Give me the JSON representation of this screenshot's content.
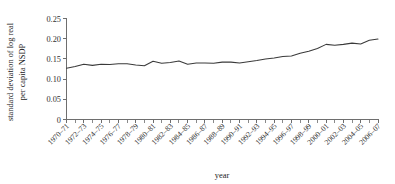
{
  "chart_data": {
    "type": "line",
    "title": "",
    "xlabel": "year",
    "ylabel": "standard deviation of log real per capita NSDP",
    "ylabel_lines": [
      "standard deviation of log real",
      "per capita NSDP"
    ],
    "ylim": [
      0,
      0.25
    ],
    "ytick_labels": [
      "0",
      "0.05",
      "0.10",
      "0.15",
      "0.20",
      "0.25"
    ],
    "ytick_values": [
      0,
      0.05,
      0.1,
      0.15,
      0.2,
      0.25
    ],
    "grid": false,
    "legend": "none",
    "line_color": "#3a3a3a",
    "categories": [
      "1970-71",
      "1971-72",
      "1972-73",
      "1973-74",
      "1974-75",
      "1975-76",
      "1976-77",
      "1977-78",
      "1978-79",
      "1979-80",
      "1980-81",
      "1981-82",
      "1982-83",
      "1983-84",
      "1984-85",
      "1985-86",
      "1986-87",
      "1987-88",
      "1988-89",
      "1989-90",
      "1990-91",
      "1991-92",
      "1992-93",
      "1993-94",
      "1994-95",
      "1995-96",
      "1996-97",
      "1997-98",
      "1998-99",
      "1999-2000",
      "2000-01",
      "2001-02",
      "2002-03",
      "2003-04",
      "2004-05",
      "2005-06",
      "2006-07"
    ],
    "xtick_labels": [
      "1970–71",
      "1972–73",
      "1974–75",
      "1976–77",
      "1978–79",
      "1980–81",
      "1982–83",
      "1984–85",
      "1986–87",
      "1988–89",
      "1990–91",
      "1992–93",
      "1994–95",
      "1996–97",
      "1998–99",
      "2000–01",
      "2002–03",
      "2004–05",
      "2006–07"
    ],
    "values": [
      0.127,
      0.131,
      0.137,
      0.134,
      0.137,
      0.136,
      0.138,
      0.138,
      0.135,
      0.133,
      0.144,
      0.139,
      0.141,
      0.145,
      0.137,
      0.14,
      0.14,
      0.139,
      0.142,
      0.142,
      0.14,
      0.143,
      0.146,
      0.15,
      0.152,
      0.156,
      0.157,
      0.164,
      0.169,
      0.176,
      0.186,
      0.184,
      0.186,
      0.189,
      0.187,
      0.196,
      0.199
    ]
  }
}
